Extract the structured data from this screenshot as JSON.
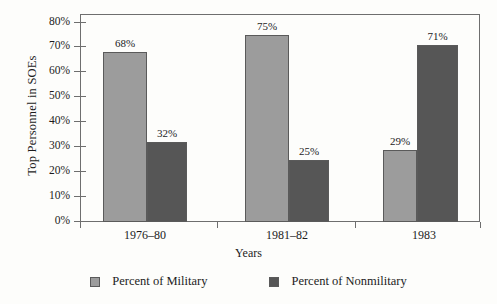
{
  "chart_data": {
    "type": "bar",
    "title": "",
    "xlabel": "Years",
    "ylabel": "Top Personnel in SOEs",
    "categories": [
      "1976–80",
      "1981–82",
      "1983"
    ],
    "series": [
      {
        "name": "Percent of Military",
        "color": "#9c9c9c",
        "values": [
          68,
          75,
          29
        ],
        "labels": [
          "68%",
          "75%",
          "29%"
        ]
      },
      {
        "name": "Percent of Nonmilitary",
        "color": "#565656",
        "values": [
          32,
          25,
          71
        ],
        "labels": [
          "32%",
          "25%",
          "71%"
        ]
      }
    ],
    "ylim": [
      0,
      80
    ],
    "ytick_values": [
      0,
      10,
      20,
      30,
      40,
      50,
      60,
      70,
      80
    ],
    "ytick_labels": [
      "0%",
      "10%",
      "20%",
      "30%",
      "40%",
      "50%",
      "60%",
      "70%",
      "80%"
    ],
    "grid": false,
    "legend_position": "bottom"
  },
  "legend": {
    "items": [
      {
        "label": "Percent of Military",
        "swatch": "light-gray-swatch"
      },
      {
        "label": "Percent of Nonmilitary",
        "swatch": "dark-gray-swatch"
      }
    ]
  },
  "colors": {
    "military": "#9c9c9c",
    "nonmilitary": "#565656",
    "axis": "#6e6e6e",
    "text": "#1c1c1c",
    "background": "#fdfdfb"
  }
}
